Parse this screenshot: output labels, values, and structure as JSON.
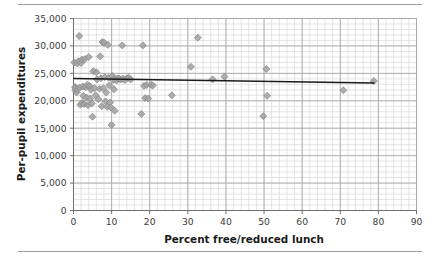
{
  "figure": {
    "has_top_rule": true,
    "has_bottom_rule": true,
    "rule_color": "#9a9a9a",
    "background": "#ffffff"
  },
  "chart_data": {
    "type": "scatter",
    "title": "",
    "xlabel": "Percent free/reduced lunch",
    "ylabel": "Per-pupil expenditures",
    "xlim": [
      0,
      90
    ],
    "ylim": [
      0,
      35000
    ],
    "xticks": [
      0,
      10,
      20,
      30,
      40,
      50,
      60,
      70,
      80,
      90
    ],
    "xtick_labels": [
      "0",
      "10",
      "20",
      "30",
      "40",
      "50",
      "60",
      "70",
      "80",
      "90"
    ],
    "yticks": [
      0,
      5000,
      10000,
      15000,
      20000,
      25000,
      30000,
      35000
    ],
    "ytick_labels": [
      "0",
      "5,000",
      "10,000",
      "15,000",
      "20,000",
      "25,000",
      "30,000",
      "35,000"
    ],
    "grid": true,
    "grid_major_color": "#a6a6a6",
    "grid_minor_color": "#d8d8d8",
    "x_minor_step": 2,
    "y_minor_step": 1000,
    "legend": false,
    "marker": {
      "shape": "diamond",
      "fill": "#a3a3a3",
      "edge": "#8c8c8c",
      "size": 7
    },
    "trendline": {
      "type": "linear",
      "color": "#1a1a1a",
      "width": 1.6,
      "x_start": 0,
      "y_start": 24050,
      "x_end": 79,
      "y_end": 23250
    },
    "series": [
      {
        "name": "Districts",
        "points": [
          [
            0.2,
            27000
          ],
          [
            0.4,
            22500
          ],
          [
            0.5,
            21900
          ],
          [
            0.6,
            22300
          ],
          [
            0.8,
            21500
          ],
          [
            1.0,
            26800
          ],
          [
            1.1,
            22100
          ],
          [
            1.3,
            27200
          ],
          [
            1.5,
            31800
          ],
          [
            1.6,
            22400
          ],
          [
            1.8,
            19300
          ],
          [
            2.0,
            26900
          ],
          [
            2.2,
            27500
          ],
          [
            2.3,
            19600
          ],
          [
            2.5,
            22600
          ],
          [
            2.6,
            20900
          ],
          [
            2.8,
            19400
          ],
          [
            3.0,
            27600
          ],
          [
            3.2,
            22500
          ],
          [
            3.4,
            20600
          ],
          [
            3.6,
            22900
          ],
          [
            3.8,
            19200
          ],
          [
            4.0,
            28000
          ],
          [
            4.2,
            22700
          ],
          [
            4.4,
            20400
          ],
          [
            4.6,
            22000
          ],
          [
            4.8,
            19500
          ],
          [
            5.0,
            17100
          ],
          [
            5.2,
            25400
          ],
          [
            5.5,
            22300
          ],
          [
            5.8,
            21000
          ],
          [
            6.0,
            25200
          ],
          [
            6.2,
            23900
          ],
          [
            6.5,
            20300
          ],
          [
            6.8,
            22200
          ],
          [
            7.0,
            28100
          ],
          [
            7.2,
            24100
          ],
          [
            7.4,
            19000
          ],
          [
            7.6,
            30700
          ],
          [
            7.8,
            22300
          ],
          [
            8.0,
            30600
          ],
          [
            8.2,
            24300
          ],
          [
            8.4,
            19900
          ],
          [
            8.6,
            21500
          ],
          [
            8.8,
            18900
          ],
          [
            9.0,
            30200
          ],
          [
            9.2,
            24200
          ],
          [
            9.4,
            22800
          ],
          [
            9.6,
            19700
          ],
          [
            9.8,
            18800
          ],
          [
            10.0,
            15600
          ],
          [
            10.2,
            24500
          ],
          [
            10.4,
            23800
          ],
          [
            10.6,
            22100
          ],
          [
            10.8,
            18200
          ],
          [
            11.0,
            24000
          ],
          [
            11.3,
            23700
          ],
          [
            11.6,
            24100
          ],
          [
            12.0,
            24000
          ],
          [
            12.4,
            23900
          ],
          [
            12.8,
            30100
          ],
          [
            13.0,
            24000
          ],
          [
            13.5,
            23800
          ],
          [
            14.0,
            24100
          ],
          [
            14.5,
            24200
          ],
          [
            15.0,
            23900
          ],
          [
            17.8,
            17600
          ],
          [
            18.2,
            30100
          ],
          [
            18.5,
            22700
          ],
          [
            18.8,
            20500
          ],
          [
            19.2,
            22900
          ],
          [
            19.6,
            20400
          ],
          [
            20.4,
            22900
          ],
          [
            20.8,
            22800
          ],
          [
            25.8,
            21000
          ],
          [
            30.8,
            26200
          ],
          [
            32.6,
            31500
          ],
          [
            36.5,
            23900
          ],
          [
            39.6,
            24400
          ],
          [
            49.8,
            17200
          ],
          [
            50.6,
            25800
          ],
          [
            50.8,
            20900
          ],
          [
            70.8,
            21900
          ],
          [
            78.8,
            23600
          ]
        ]
      }
    ]
  }
}
